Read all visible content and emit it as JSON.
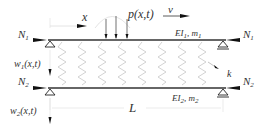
{
  "diagram": {
    "type": "double-beam system with elastic layer under moving load",
    "labels": {
      "axial_force_top_left": "N",
      "axial_force_top_left_sub": "1",
      "axial_force_top_right": "N",
      "axial_force_top_right_sub": "1",
      "axial_force_bottom_left": "N",
      "axial_force_bottom_left_sub": "2",
      "axial_force_bottom_right": "N",
      "axial_force_bottom_right_sub": "2",
      "coordinate_x": "x",
      "load": "p(x,t)",
      "velocity": "v",
      "beam1_props_EI": "EI",
      "beam1_props_EI_sub": "1",
      "beam1_props_m": ", m",
      "beam1_props_m_sub": "1",
      "beam2_props_EI": "EI",
      "beam2_props_EI_sub": "2",
      "beam2_props_m": ", m",
      "beam2_props_m_sub": "2",
      "deflection1": "w",
      "deflection1_sub": "1",
      "deflection1_args": "(x,t)",
      "deflection2": "w",
      "deflection2_sub": "2",
      "deflection2_args": "(x,t)",
      "spring_stiffness": "k",
      "length": "L"
    },
    "colors": {
      "beam": "#333333",
      "spring": "#c8c8c8",
      "arrow": "#111111",
      "dimension": "#cccccc"
    }
  }
}
